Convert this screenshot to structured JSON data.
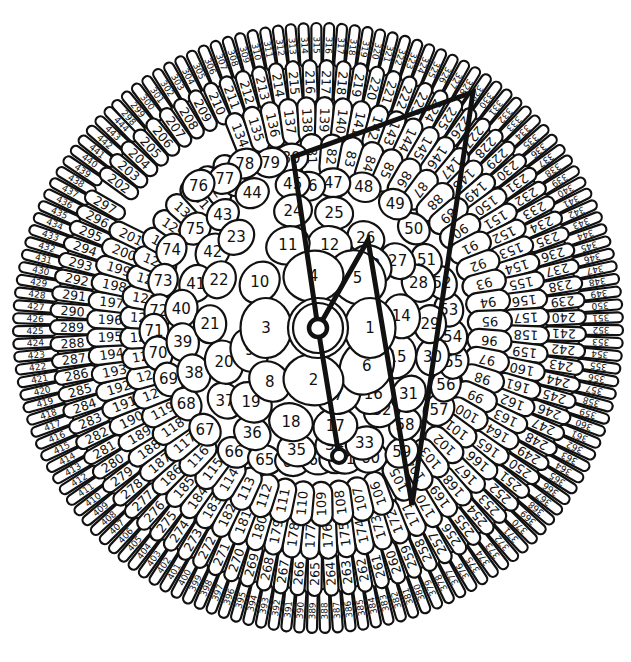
{
  "diagram": {
    "center": {
      "x": 318,
      "y": 328
    },
    "colors": {
      "stroke": "#111111",
      "fill": "#ffffff",
      "path": "#111111"
    },
    "inner": [
      {
        "n": 1,
        "a": 90,
        "r": 52
      },
      {
        "n": 2,
        "a": 185,
        "r": 52
      },
      {
        "n": 3,
        "a": 270,
        "r": 52
      },
      {
        "n": 4,
        "a": 355,
        "r": 52
      },
      {
        "n": 5,
        "a": 38,
        "r": 64
      },
      {
        "n": 6,
        "a": 128,
        "r": 62
      },
      {
        "n": 7,
        "a": 163,
        "r": 70
      },
      {
        "n": 8,
        "a": 222,
        "r": 72
      },
      {
        "n": 9,
        "a": 252,
        "r": 72
      },
      {
        "n": 10,
        "a": 308,
        "r": 74
      },
      {
        "n": 11,
        "a": 340,
        "r": 88
      },
      {
        "n": 12,
        "a": 8,
        "r": 84
      },
      {
        "n": 13,
        "a": 40,
        "r": 82
      },
      {
        "n": 14,
        "a": 82,
        "r": 84
      },
      {
        "n": 15,
        "a": 110,
        "r": 84
      },
      {
        "n": 16,
        "a": 140,
        "r": 86
      },
      {
        "n": 17,
        "a": 170,
        "r": 100
      },
      {
        "n": 18,
        "a": 196,
        "r": 98
      },
      {
        "n": 19,
        "a": 222,
        "r": 100
      },
      {
        "n": 20,
        "a": 250,
        "r": 100
      },
      {
        "n": 21,
        "a": 272,
        "r": 108
      },
      {
        "n": 22,
        "a": 296,
        "r": 110
      },
      {
        "n": 23,
        "a": 318,
        "r": 122
      },
      {
        "n": 24,
        "a": 348,
        "r": 120
      },
      {
        "n": 25,
        "a": 8,
        "r": 116
      },
      {
        "n": 26,
        "a": 28,
        "r": 102
      },
      {
        "n": 27,
        "a": 50,
        "r": 104
      },
      {
        "n": 28,
        "a": 66,
        "r": 110
      },
      {
        "n": 29,
        "a": 88,
        "r": 112
      },
      {
        "n": 30,
        "a": 104,
        "r": 118
      },
      {
        "n": 31,
        "a": 126,
        "r": 112
      },
      {
        "n": 32,
        "a": 142,
        "r": 104
      },
      {
        "n": 33,
        "a": 158,
        "r": 124
      },
      {
        "n": 34,
        "a": 172,
        "r": 118
      },
      {
        "n": 35,
        "a": 190,
        "r": 124
      },
      {
        "n": 36,
        "a": 212,
        "r": 124
      },
      {
        "n": 37,
        "a": 232,
        "r": 118
      },
      {
        "n": 38,
        "a": 250,
        "r": 132
      },
      {
        "n": 39,
        "a": 264,
        "r": 136
      },
      {
        "n": 40,
        "a": 278,
        "r": 138
      },
      {
        "n": 41,
        "a": 290,
        "r": 130
      },
      {
        "n": 42,
        "a": 306,
        "r": 130
      },
      {
        "n": 43,
        "a": 320,
        "r": 148
      },
      {
        "n": 44,
        "a": 334,
        "r": 150
      },
      {
        "n": 45,
        "a": 350,
        "r": 146
      },
      {
        "n": 46,
        "a": 356,
        "r": 142
      },
      {
        "n": 47,
        "a": 6,
        "r": 146
      },
      {
        "n": 48,
        "a": 18,
        "r": 148
      },
      {
        "n": 49,
        "a": 32,
        "r": 146
      },
      {
        "n": 50,
        "a": 44,
        "r": 138
      },
      {
        "n": 51,
        "a": 58,
        "r": 128
      },
      {
        "n": 52,
        "a": 70,
        "r": 132
      },
      {
        "n": 53,
        "a": 82,
        "r": 132
      },
      {
        "n": 54,
        "a": 94,
        "r": 135
      },
      {
        "n": 55,
        "a": 104,
        "r": 140
      },
      {
        "n": 56,
        "a": 114,
        "r": 140
      },
      {
        "n": 57,
        "a": 124,
        "r": 146
      },
      {
        "n": 58,
        "a": 138,
        "r": 130
      },
      {
        "n": 59,
        "a": 146,
        "r": 150
      },
      {
        "n": 60,
        "a": 158,
        "r": 140
      },
      {
        "n": 61,
        "a": 168,
        "r": 134
      },
      {
        "n": 62,
        "a": 172,
        "r": 132
      },
      {
        "n": 63,
        "a": 180,
        "r": 132
      },
      {
        "n": 64,
        "a": 191,
        "r": 136
      },
      {
        "n": 65,
        "a": 202,
        "r": 142
      },
      {
        "n": 66,
        "a": 214,
        "r": 150
      },
      {
        "n": 67,
        "a": 228,
        "r": 152
      },
      {
        "n": 68,
        "a": 240,
        "r": 152
      },
      {
        "n": 69,
        "a": 251,
        "r": 158
      },
      {
        "n": 70,
        "a": 261,
        "r": 162
      },
      {
        "n": 71,
        "a": 269,
        "r": 164
      },
      {
        "n": 72,
        "a": 276,
        "r": 160
      },
      {
        "n": 73,
        "a": 287,
        "r": 162
      },
      {
        "n": 74,
        "a": 298,
        "r": 166
      },
      {
        "n": 75,
        "a": 309,
        "r": 158
      },
      {
        "n": 76,
        "a": 320,
        "r": 186
      },
      {
        "n": 77,
        "a": 328,
        "r": 176
      },
      {
        "n": 78,
        "a": 336,
        "r": 180
      },
      {
        "n": 79,
        "a": 344,
        "r": 172
      },
      {
        "n": 80,
        "a": 351,
        "r": 172
      }
    ],
    "rings": [
      {
        "from": 81,
        "to": 105,
        "start_angle": 358,
        "end_angle": 152,
        "radius": 172,
        "len": 44,
        "wid": 22
      },
      {
        "from": 106,
        "to": 133,
        "start_angle": 160,
        "end_angle": 330,
        "radius": 176,
        "len": 44,
        "wid": 22,
        "note": "continues around"
      },
      {
        "from": 134,
        "to": 201,
        "start_angle": 338,
        "end_angle": 296,
        "radius": 208,
        "len": 46,
        "wid": 18
      },
      {
        "from": 202,
        "to": 297,
        "start_angle": 306,
        "end_angle": 300,
        "radius": 246,
        "len": 44,
        "wid": 14
      },
      {
        "from": 298,
        "to": 444,
        "start_angle": 318,
        "end_angle": 316,
        "radius": 283,
        "len": 44,
        "wid": 10
      }
    ],
    "path": {
      "points": [
        {
          "label": "center",
          "x": 318,
          "y": 328
        },
        {
          "label": "26",
          "x": 368,
          "y": 240
        },
        {
          "label": "168",
          "x": 412,
          "y": 505
        },
        {
          "label": "329",
          "x": 473,
          "y": 92
        },
        {
          "label": "81",
          "x": 293,
          "y": 157
        },
        {
          "label": "center-pass",
          "x": 318,
          "y": 328
        },
        {
          "label": "62",
          "x": 339,
          "y": 456
        }
      ],
      "start_marker": {
        "x": 318,
        "y": 328
      },
      "end_marker": {
        "x": 339,
        "y": 456
      }
    }
  }
}
